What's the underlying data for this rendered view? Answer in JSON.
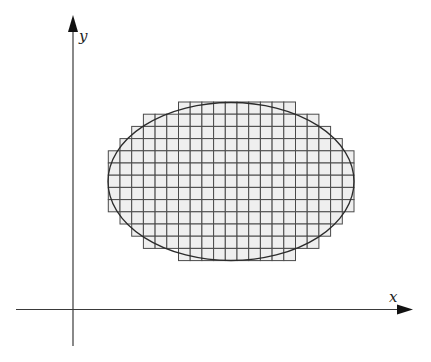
{
  "diagram": {
    "title": "",
    "axes": {
      "x": {
        "label": "x",
        "start": [
          16,
          309.5
        ],
        "end": [
          413,
          309.5
        ],
        "label_pos": [
          389,
          302
        ]
      },
      "y": {
        "label": "y",
        "start": [
          73,
          346
        ],
        "end": [
          73,
          15
        ],
        "label_pos": [
          79,
          41
        ]
      },
      "color": "#3a3a3a",
      "arrow_color": "#111111"
    },
    "grid": {
      "origin_x": 108.3,
      "origin_y": 102,
      "cell_w": 11.7,
      "cell_h": 12.2,
      "columns": 21,
      "rows": 13,
      "fill": "#efefef",
      "stroke": "#4a4a4a",
      "row_spans": [
        {
          "row": 0,
          "start_col": 6,
          "end_col": 15
        },
        {
          "row": 1,
          "start_col": 3,
          "end_col": 17
        },
        {
          "row": 2,
          "start_col": 2,
          "end_col": 18
        },
        {
          "row": 3,
          "start_col": 1,
          "end_col": 19
        },
        {
          "row": 4,
          "start_col": 0,
          "end_col": 20
        },
        {
          "row": 5,
          "start_col": 0,
          "end_col": 20
        },
        {
          "row": 6,
          "start_col": 0,
          "end_col": 20
        },
        {
          "row": 7,
          "start_col": 0,
          "end_col": 20
        },
        {
          "row": 8,
          "start_col": 0,
          "end_col": 20
        },
        {
          "row": 9,
          "start_col": 1,
          "end_col": 19
        },
        {
          "row": 10,
          "start_col": 2,
          "end_col": 18
        },
        {
          "row": 11,
          "start_col": 3,
          "end_col": 17
        },
        {
          "row": 12,
          "start_col": 6,
          "end_col": 15
        }
      ]
    },
    "ellipse": {
      "cx": 231,
      "cy": 181.5,
      "rx": 123,
      "ry": 79,
      "stroke": "#2b2b2b"
    }
  }
}
